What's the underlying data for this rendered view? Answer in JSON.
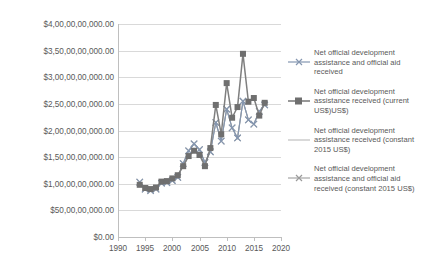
{
  "chart_data": {
    "type": "line",
    "title": "",
    "xlabel": "",
    "ylabel": "",
    "xlim": [
      1990,
      2020
    ],
    "ylim": [
      0,
      40000000000
    ],
    "grid": true,
    "legend_position": "right",
    "x_ticks": [
      "1990",
      "1995",
      "2000",
      "2005",
      "2010",
      "2015",
      "2020"
    ],
    "y_ticks": [
      "$0.00",
      "$50,00,00,000.00",
      "$1,00,00,00,000.00",
      "$1,50,00,00,000.00",
      "$2,00,00,00,000.00",
      "$2,50,00,00,000.00",
      "$3,00,00,00,000.00",
      "$3,50,00,00,000.00",
      "$4,00,00,00,000.00"
    ],
    "y_tick_values": [
      0,
      5000000000,
      10000000000,
      15000000000,
      20000000000,
      25000000000,
      30000000000,
      35000000000,
      40000000000
    ],
    "x": [
      1994,
      1995,
      1996,
      1997,
      1998,
      1999,
      2000,
      2001,
      2002,
      2003,
      2004,
      2005,
      2006,
      2007,
      2008,
      2009,
      2010,
      2011,
      2012,
      2013,
      2014,
      2015,
      2016,
      2017
    ],
    "series": [
      {
        "name": "Net official development assistance and official aid received",
        "color": "#8496b0",
        "marker": "cross",
        "values": [
          10300000000,
          9000000000,
          8700000000,
          9000000000,
          10100000000,
          10200000000,
          10600000000,
          11200000000,
          13800000000,
          16200000000,
          17500000000,
          16400000000,
          14000000000,
          16000000000,
          21500000000,
          18000000000,
          24000000000,
          20500000000,
          18600000000,
          25500000000,
          22000000000,
          21200000000,
          23600000000,
          24800000000
        ]
      },
      {
        "name": "Net official development assistance received (current US$)US$)",
        "color": "#7f7f7f",
        "marker": "square",
        "values": [
          9800000000,
          9200000000,
          9000000000,
          9300000000,
          10400000000,
          10500000000,
          11000000000,
          11600000000,
          13300000000,
          15200000000,
          16200000000,
          15400000000,
          13300000000,
          16700000000,
          24800000000,
          19300000000,
          28900000000,
          22400000000,
          24400000000,
          34400000000,
          25400000000,
          26100000000,
          22800000000,
          25200000000
        ]
      },
      {
        "name": "Net official development assistance received (constant 2015 US$)",
        "color": "#bfbfbf",
        "marker": "line",
        "values": [
          10300000000,
          9000000000,
          8700000000,
          9000000000,
          10100000000,
          10200000000,
          10600000000,
          11200000000,
          13800000000,
          16200000000,
          17500000000,
          16400000000,
          14000000000,
          16000000000,
          21500000000,
          18000000000,
          24000000000,
          20500000000,
          18600000000,
          25500000000,
          22000000000,
          21200000000,
          23600000000,
          24800000000
        ]
      },
      {
        "name": "Net official development assistance and official aid received (constant 2015 US$)",
        "color": "#a6a6a6",
        "marker": "cross",
        "values": [
          10300000000,
          9000000000,
          8700000000,
          9000000000,
          10100000000,
          10200000000,
          10600000000,
          11200000000,
          13800000000,
          16200000000,
          17500000000,
          16400000000,
          14000000000,
          16000000000,
          21500000000,
          18000000000,
          24000000000,
          20500000000,
          18600000000,
          25500000000,
          22000000000,
          21200000000,
          23600000000,
          24800000000
        ]
      }
    ]
  },
  "legend": {
    "entries": [
      {
        "label": "Net official development assistance and official aid received",
        "marker_name": "legend-marker-aid-received"
      },
      {
        "label": "Net official development assistance received (current US$)US$)",
        "marker_name": "legend-marker-current-usd"
      },
      {
        "label": "Net official development assistance received (constant 2015 US$)",
        "marker_name": "legend-marker-constant-2015"
      },
      {
        "label": "Net official development assistance and official aid received (constant 2015 US$)",
        "marker_name": "legend-marker-aid-constant-2015"
      }
    ]
  }
}
